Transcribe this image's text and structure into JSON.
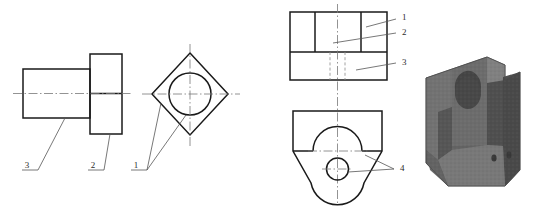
{
  "figure": {
    "background_color": "#ffffff",
    "line_color": "#1a1a1a",
    "centerline_color": "#777777",
    "hidden_line_color": "#8a8a8a",
    "leader_color": "#555555",
    "solid_color": "#6f6f6f"
  },
  "views": [
    {
      "id": "left-front-view",
      "name": "front-view-stepped-shaft",
      "description": "Stepped shaft front view: small rectangular shank on the left joined to a taller flange block on the right, bisected by a horizontal centerline"
    },
    {
      "id": "left-side-view",
      "name": "side-view-diamond-with-bore",
      "description": "Square rotated 45 degrees (diamond) with a concentric circular bore, vertical and horizontal centerlines"
    },
    {
      "id": "mid-top-view",
      "name": "top-view-banded-rectangle",
      "description": "Rectangle divided into an upper band split into three cells and a lower band with two hidden (dashed) vertical lines"
    },
    {
      "id": "mid-bottom-view",
      "name": "front-view-wedge-with-arch",
      "description": "Rectangular upper body with a semicircular arch recess, tapering to a V wedge with a rounded tip containing a small circular hole"
    },
    {
      "id": "solid-model",
      "name": "isometric-solid-model",
      "description": "Shaded 3D isometric pictorial of the finished part"
    }
  ],
  "callouts": [
    {
      "id": "c-left-3",
      "label": "3",
      "view": "left-front-view",
      "x": 27,
      "y": 166
    },
    {
      "id": "c-left-2",
      "label": "2",
      "view": "left-front-view",
      "x": 93,
      "y": 166
    },
    {
      "id": "c-left-1",
      "label": "1",
      "view": "left-side-view",
      "x": 136,
      "y": 166
    },
    {
      "id": "c-mid-1",
      "label": "1",
      "view": "mid-top-view",
      "x": 400,
      "y": 17
    },
    {
      "id": "c-mid-2",
      "label": "2",
      "view": "mid-top-view",
      "x": 400,
      "y": 32
    },
    {
      "id": "c-mid-3",
      "label": "3",
      "view": "mid-top-view",
      "x": 400,
      "y": 62
    },
    {
      "id": "c-mid-4",
      "label": "4",
      "view": "mid-bottom-view",
      "x": 399,
      "y": 168
    }
  ]
}
